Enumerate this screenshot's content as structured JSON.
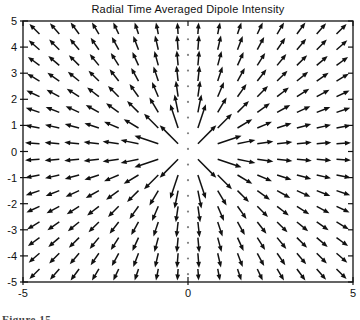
{
  "caption": {
    "text": "Figure 15"
  },
  "chart_data": {
    "type": "quiver",
    "title": "Radial Time Averaged Dipole Intensity",
    "xlabel": "",
    "ylabel": "",
    "xlim": [
      -5,
      5
    ],
    "ylim": [
      -5,
      5
    ],
    "grid": true,
    "legend": "none",
    "xticks": [
      {
        "value": -5,
        "label": "-5"
      },
      {
        "value": 0,
        "label": "0"
      },
      {
        "value": 5,
        "label": "5"
      }
    ],
    "yticks": [
      {
        "value": 5,
        "label": "5"
      },
      {
        "value": 4,
        "label": "4"
      },
      {
        "value": 3,
        "label": "3"
      },
      {
        "value": 2,
        "label": "2"
      },
      {
        "value": 1,
        "label": "1"
      },
      {
        "value": 0,
        "label": "0"
      },
      {
        "value": -1,
        "label": "-1"
      },
      {
        "value": -2,
        "label": "-2"
      },
      {
        "value": -3,
        "label": "-3"
      },
      {
        "value": -4,
        "label": "-4"
      },
      {
        "value": -5,
        "label": "-5"
      }
    ],
    "grid_x": [
      -4.5,
      -3.9,
      -3.3,
      -2.7,
      -2.1,
      -1.5,
      -0.9,
      -0.3,
      0.3,
      0.9,
      1.5,
      2.1,
      2.7,
      3.3,
      3.9,
      4.5
    ],
    "grid_y": [
      -4.5,
      -3.9,
      -3.3,
      -2.7,
      -2.1,
      -1.5,
      -0.9,
      -0.3,
      0.3,
      0.9,
      1.5,
      2.1,
      2.7,
      3.3,
      3.9,
      4.5
    ],
    "field": {
      "name": "time-averaged dipole radiation flux",
      "direction": "radially outward from origin",
      "formula": "<S> ∝ (sin²θ / r²) r̂",
      "dipole_axis": "vertical line x=0, flux zero along it, drawn as dotted line",
      "dotted_axis_x": 0,
      "dotted_axis_dot_step": 0.6
    },
    "style": {
      "arrow_color": "#111111",
      "axis_color": "#111111",
      "dotted_axis_color": "#808080",
      "background": "#ffffff",
      "arrow_len_base_px": 14,
      "arrow_len_boost_px": 10,
      "arrow_len_max_px": 26,
      "head_len_px": 6,
      "head_halfwidth_px": 2.4
    }
  }
}
